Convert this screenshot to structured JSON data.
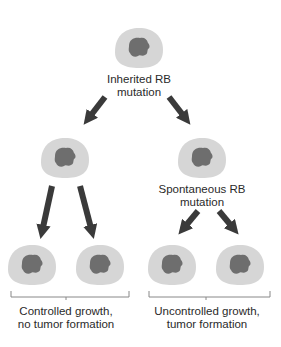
{
  "colors": {
    "cell": "#d6d6d6",
    "nucleus": "#6e6e6e",
    "arrow": "#3a3a3a",
    "bracket": "#888888",
    "text": "#2a2a2a"
  },
  "labels": {
    "top": [
      "Inherited RB",
      "mutation"
    ],
    "spontaneous": [
      "Spontaneous RB",
      "mutation"
    ],
    "left_outcome": [
      "Controlled growth,",
      "no tumor formation"
    ],
    "right_outcome": [
      "Uncontrolled growth,",
      "tumor formation"
    ]
  },
  "nodes": [
    {
      "id": "top-cell",
      "level": 0
    },
    {
      "id": "mid-left-cell",
      "level": 1
    },
    {
      "id": "mid-right-cell",
      "level": 1
    },
    {
      "id": "bottom-cell-1",
      "level": 2
    },
    {
      "id": "bottom-cell-2",
      "level": 2
    },
    {
      "id": "bottom-cell-3",
      "level": 2
    },
    {
      "id": "bottom-cell-4",
      "level": 2
    }
  ]
}
